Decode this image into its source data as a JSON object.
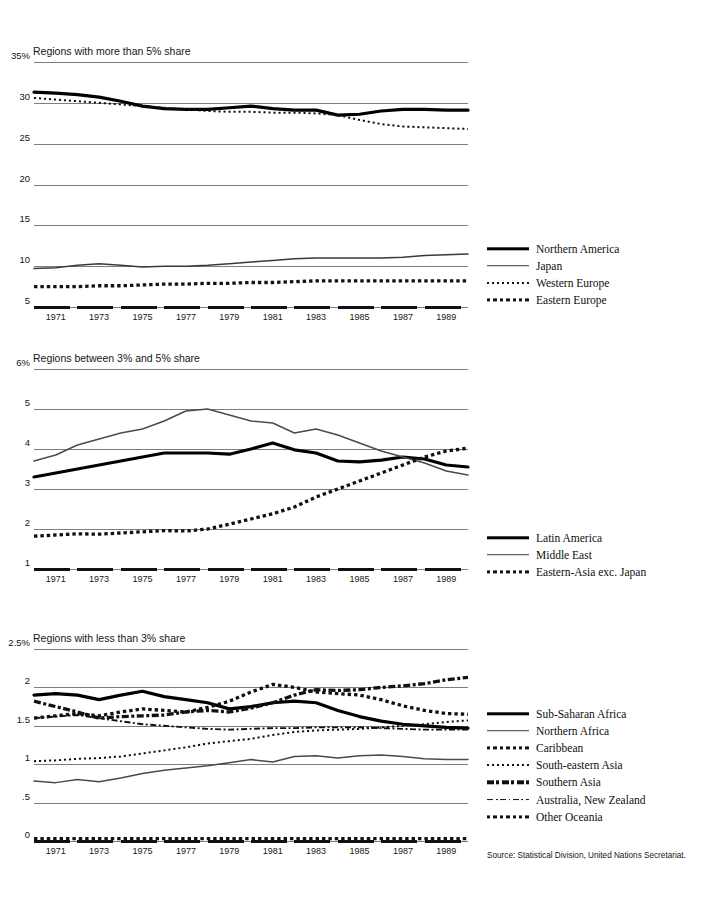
{
  "document": {
    "top_clipped_text": "",
    "source_note": "Source: Statistical Division, United Nations Secretariat."
  },
  "axis": {
    "years": [
      1971,
      1973,
      1975,
      1977,
      1979,
      1981,
      1983,
      1985,
      1987,
      1989
    ],
    "x_start": 1970,
    "x_end": 1990
  },
  "chart_data": [
    {
      "type": "line",
      "title": "Regions with more than 5% share",
      "xlabel": "",
      "ylabel": "",
      "ylim": [
        5,
        35
      ],
      "yticks": [
        35,
        30,
        25,
        20,
        15,
        10,
        5
      ],
      "ytick_labels": [
        "35%",
        "30",
        "25",
        "20",
        "15",
        "10",
        "5"
      ],
      "grid": true,
      "legend_position": "right",
      "x": [
        1970,
        1971,
        1972,
        1973,
        1974,
        1975,
        1976,
        1977,
        1978,
        1979,
        1980,
        1981,
        1982,
        1983,
        1984,
        1985,
        1986,
        1987,
        1988,
        1989,
        1990
      ],
      "series": [
        {
          "name": "Northern America",
          "style": "solid-thick",
          "color": "#000000",
          "values": [
            31.3,
            31.2,
            31.0,
            30.7,
            30.2,
            29.6,
            29.3,
            29.2,
            29.2,
            29.4,
            29.6,
            29.3,
            29.1,
            29.1,
            28.5,
            28.6,
            29.0,
            29.2,
            29.2,
            29.1,
            29.1
          ]
        },
        {
          "name": "Japan",
          "style": "solid-thin",
          "color": "#3a3a3a",
          "values": [
            9.7,
            9.8,
            10.1,
            10.3,
            10.1,
            9.9,
            10.0,
            10.0,
            10.1,
            10.3,
            10.5,
            10.7,
            10.9,
            11.0,
            11.0,
            11.0,
            11.0,
            11.1,
            11.3,
            11.4,
            11.5
          ]
        },
        {
          "name": "Western Europe",
          "style": "dotted-fine",
          "color": "#111111",
          "values": [
            30.6,
            30.4,
            30.2,
            30.0,
            29.8,
            29.6,
            29.4,
            29.2,
            29.0,
            28.9,
            28.9,
            28.8,
            28.8,
            28.7,
            28.5,
            27.9,
            27.4,
            27.1,
            27.0,
            26.9,
            26.8
          ]
        },
        {
          "name": "Eastern Europe",
          "style": "dotted-bold",
          "color": "#111111",
          "values": [
            7.5,
            7.5,
            7.5,
            7.6,
            7.6,
            7.7,
            7.8,
            7.8,
            7.9,
            7.9,
            8.0,
            8.0,
            8.1,
            8.2,
            8.2,
            8.2,
            8.2,
            8.2,
            8.2,
            8.2,
            8.2
          ]
        }
      ]
    },
    {
      "type": "line",
      "title": "Regions between 3% and 5% share",
      "xlabel": "",
      "ylabel": "",
      "ylim": [
        1,
        6
      ],
      "yticks": [
        6,
        5,
        4,
        3,
        2,
        1
      ],
      "ytick_labels": [
        "6%",
        "5",
        "4",
        "3",
        "2",
        "1"
      ],
      "grid": true,
      "legend_position": "right",
      "x": [
        1970,
        1971,
        1972,
        1973,
        1974,
        1975,
        1976,
        1977,
        1978,
        1979,
        1980,
        1981,
        1982,
        1983,
        1984,
        1985,
        1986,
        1987,
        1988,
        1989,
        1990
      ],
      "series": [
        {
          "name": "Latin America",
          "style": "solid-thick",
          "color": "#000000",
          "values": [
            3.3,
            3.4,
            3.5,
            3.6,
            3.7,
            3.8,
            3.9,
            3.9,
            3.9,
            3.87,
            4.0,
            4.15,
            3.98,
            3.9,
            3.7,
            3.68,
            3.72,
            3.8,
            3.75,
            3.6,
            3.55
          ]
        },
        {
          "name": "Middle East",
          "style": "solid-thin",
          "color": "#4a4a4a",
          "values": [
            3.7,
            3.85,
            4.1,
            4.25,
            4.4,
            4.5,
            4.7,
            4.95,
            5.0,
            4.85,
            4.7,
            4.65,
            4.4,
            4.5,
            4.35,
            4.15,
            3.95,
            3.8,
            3.65,
            3.45,
            3.35
          ]
        },
        {
          "name": "Eastern-Asia exc. Japan",
          "style": "dotted-bold",
          "color": "#111111",
          "values": [
            1.82,
            1.85,
            1.88,
            1.87,
            1.9,
            1.93,
            1.96,
            1.95,
            2.0,
            2.12,
            2.25,
            2.38,
            2.55,
            2.8,
            3.0,
            3.2,
            3.4,
            3.6,
            3.8,
            3.95,
            4.02
          ]
        }
      ]
    },
    {
      "type": "line",
      "title": "Regions with less than 3% share",
      "xlabel": "",
      "ylabel": "",
      "ylim": [
        0,
        2.5
      ],
      "yticks": [
        2.5,
        2,
        1.5,
        1,
        0.5,
        0
      ],
      "ytick_labels": [
        "2.5%",
        "2",
        "1.5",
        "1",
        ".5",
        "0"
      ],
      "grid": true,
      "legend_position": "right",
      "x": [
        1970,
        1971,
        1972,
        1973,
        1974,
        1975,
        1976,
        1977,
        1978,
        1979,
        1980,
        1981,
        1982,
        1983,
        1984,
        1985,
        1986,
        1987,
        1988,
        1989,
        1990
      ],
      "series": [
        {
          "name": "Sub-Saharan Africa",
          "style": "solid-thick",
          "color": "#000000",
          "values": [
            1.9,
            1.92,
            1.9,
            1.84,
            1.9,
            1.95,
            1.88,
            1.84,
            1.8,
            1.72,
            1.75,
            1.8,
            1.82,
            1.8,
            1.7,
            1.62,
            1.56,
            1.52,
            1.5,
            1.48,
            1.47
          ]
        },
        {
          "name": "Northern Africa",
          "style": "solid-thin",
          "color": "#4a4a4a",
          "values": [
            0.78,
            0.76,
            0.8,
            0.77,
            0.82,
            0.88,
            0.92,
            0.95,
            0.98,
            1.02,
            1.06,
            1.03,
            1.1,
            1.11,
            1.08,
            1.11,
            1.12,
            1.1,
            1.07,
            1.06,
            1.06
          ]
        },
        {
          "name": "Caribbean",
          "style": "dotted-bold",
          "color": "#111111",
          "values": [
            1.6,
            1.63,
            1.66,
            1.63,
            1.68,
            1.72,
            1.7,
            1.68,
            1.74,
            1.82,
            1.94,
            2.04,
            2.0,
            1.94,
            1.92,
            1.9,
            1.84,
            1.76,
            1.7,
            1.66,
            1.65
          ]
        },
        {
          "name": "South-eastern Asia",
          "style": "dotted-fine",
          "color": "#111111",
          "values": [
            1.04,
            1.05,
            1.07,
            1.08,
            1.1,
            1.14,
            1.18,
            1.22,
            1.27,
            1.3,
            1.33,
            1.38,
            1.42,
            1.44,
            1.45,
            1.46,
            1.48,
            1.5,
            1.52,
            1.55,
            1.57
          ]
        },
        {
          "name": "Southern Asia",
          "style": "dashdot-bold",
          "color": "#111111",
          "values": [
            1.82,
            1.75,
            1.68,
            1.6,
            1.62,
            1.63,
            1.64,
            1.68,
            1.7,
            1.68,
            1.73,
            1.8,
            1.9,
            1.97,
            1.96,
            1.97,
            2.0,
            2.02,
            2.05,
            2.1,
            2.13
          ]
        },
        {
          "name": "Australia, New Zealand",
          "style": "dashdot-thin",
          "color": "#111111",
          "values": [
            1.6,
            1.62,
            1.64,
            1.6,
            1.56,
            1.52,
            1.5,
            1.48,
            1.46,
            1.45,
            1.46,
            1.47,
            1.47,
            1.48,
            1.48,
            1.48,
            1.47,
            1.46,
            1.45,
            1.45,
            1.45
          ]
        },
        {
          "name": "Other Oceania",
          "style": "dotted-bold",
          "color": "#111111",
          "values": [
            0.03,
            0.03,
            0.03,
            0.03,
            0.03,
            0.03,
            0.03,
            0.03,
            0.03,
            0.03,
            0.03,
            0.03,
            0.03,
            0.03,
            0.03,
            0.03,
            0.03,
            0.03,
            0.03,
            0.03,
            0.03
          ]
        }
      ]
    }
  ]
}
